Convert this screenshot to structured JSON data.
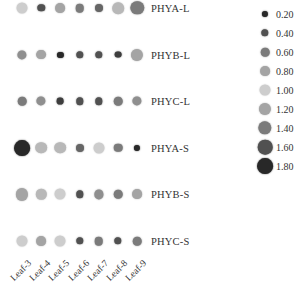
{
  "chart_data": {
    "type": "dot_heatmap",
    "title": "",
    "xlabel": "",
    "ylabel": "",
    "categories": [
      "Leaf-3",
      "Leaf-4",
      "Leaf-5",
      "Leaf-6",
      "Leaf-7",
      "Leaf-8",
      "Leaf-9"
    ],
    "rows": [
      "PHYA-L",
      "PHYB-L",
      "PHYC-L",
      "PHYA-S",
      "PHYB-S",
      "PHYC-S"
    ],
    "series": [
      {
        "name": "PHYA-L",
        "values": [
          1.0,
          0.4,
          0.8,
          0.6,
          0.5,
          1.1,
          1.4
        ]
      },
      {
        "name": "PHYB-L",
        "values": [
          0.7,
          0.8,
          0.2,
          0.4,
          0.4,
          0.3,
          1.2
        ]
      },
      {
        "name": "PHYC-L",
        "values": [
          0.6,
          0.7,
          0.3,
          0.4,
          0.4,
          0.6,
          0.7
        ]
      },
      {
        "name": "PHYA-S",
        "values": [
          1.8,
          1.1,
          1.1,
          0.5,
          1.0,
          0.6,
          0.2
        ]
      },
      {
        "name": "PHYB-S",
        "values": [
          1.2,
          0.9,
          1.0,
          0.4,
          0.7,
          0.6,
          0.8
        ]
      },
      {
        "name": "PHYC-S",
        "values": [
          1.0,
          0.8,
          1.0,
          0.4,
          0.6,
          0.4,
          0.6
        ]
      }
    ],
    "legend": {
      "position": "right",
      "entries": [
        "0.20",
        "0.40",
        "0.60",
        "0.80",
        "1.00",
        "1.20",
        "1.40",
        "1.60",
        "1.80"
      ],
      "values": [
        0.2,
        0.4,
        0.6,
        0.8,
        1.0,
        1.2,
        1.4,
        1.6,
        1.8
      ]
    },
    "encoding": "dot size and grey shade; lightest near 1.00, darker below and above, larger for higher values",
    "grid": false
  }
}
